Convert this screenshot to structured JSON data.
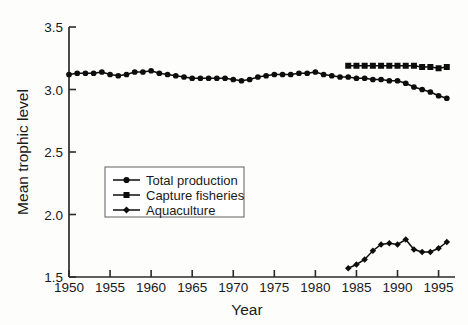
{
  "chart_data": {
    "type": "line",
    "title": "",
    "xlabel": "Year",
    "ylabel": "Mean trophic level",
    "xlim": [
      1950,
      1997
    ],
    "ylim": [
      1.5,
      3.5
    ],
    "xticks": [
      1950,
      1955,
      1960,
      1965,
      1970,
      1975,
      1980,
      1985,
      1990,
      1995
    ],
    "yticks": [
      1.5,
      2.0,
      2.5,
      3.0,
      3.5
    ],
    "ytick_labels": [
      "1.5",
      "2.0",
      "2.5",
      "3.0",
      "3.5"
    ],
    "xtick_labels": [
      "1950",
      "1955",
      "1960",
      "1965",
      "1970",
      "1975",
      "1980",
      "1985",
      "1990",
      "1995"
    ],
    "grid": false,
    "legend_position": "center-left",
    "series": [
      {
        "name": "Total production",
        "marker": "circle",
        "x": [
          1950,
          1951,
          1952,
          1953,
          1954,
          1955,
          1956,
          1957,
          1958,
          1959,
          1960,
          1961,
          1962,
          1963,
          1964,
          1965,
          1966,
          1967,
          1968,
          1969,
          1970,
          1971,
          1972,
          1973,
          1974,
          1975,
          1976,
          1977,
          1978,
          1979,
          1980,
          1981,
          1982,
          1983,
          1984,
          1985,
          1986,
          1987,
          1988,
          1989,
          1990,
          1991,
          1992,
          1993,
          1994,
          1995,
          1996
        ],
        "values": [
          3.12,
          3.13,
          3.13,
          3.13,
          3.14,
          3.12,
          3.11,
          3.12,
          3.14,
          3.14,
          3.15,
          3.13,
          3.12,
          3.11,
          3.1,
          3.09,
          3.09,
          3.09,
          3.09,
          3.09,
          3.08,
          3.07,
          3.08,
          3.1,
          3.11,
          3.12,
          3.12,
          3.12,
          3.13,
          3.13,
          3.14,
          3.12,
          3.11,
          3.1,
          3.1,
          3.09,
          3.09,
          3.08,
          3.08,
          3.07,
          3.07,
          3.05,
          3.02,
          3.0,
          2.98,
          2.95,
          2.93
        ]
      },
      {
        "name": "Capture fisheries",
        "marker": "square",
        "x": [
          1984,
          1985,
          1986,
          1987,
          1988,
          1989,
          1990,
          1991,
          1992,
          1993,
          1994,
          1995,
          1996
        ],
        "values": [
          3.19,
          3.19,
          3.19,
          3.19,
          3.19,
          3.19,
          3.19,
          3.19,
          3.19,
          3.18,
          3.18,
          3.17,
          3.18
        ]
      },
      {
        "name": "Aquaculture",
        "marker": "diamond",
        "x": [
          1984,
          1985,
          1986,
          1987,
          1988,
          1989,
          1990,
          1991,
          1992,
          1993,
          1994,
          1995,
          1996
        ],
        "values": [
          1.57,
          1.6,
          1.64,
          1.71,
          1.76,
          1.77,
          1.76,
          1.8,
          1.72,
          1.7,
          1.7,
          1.73,
          1.78
        ]
      }
    ]
  },
  "legend": {
    "entries": [
      {
        "label": "Total production",
        "marker": "circle"
      },
      {
        "label": "Capture fisheries",
        "marker": "square"
      },
      {
        "label": "Aquaculture",
        "marker": "diamond"
      }
    ]
  }
}
